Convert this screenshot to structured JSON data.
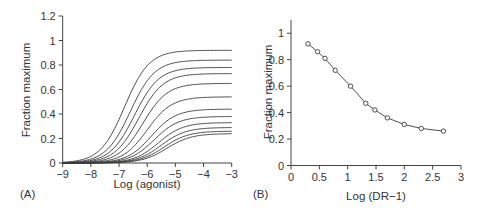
{
  "chart_data": [
    {
      "panel": "(A)",
      "type": "line",
      "title": "",
      "xlabel": "Log (agonist)",
      "ylabel": "Fraction maximum",
      "xlim": [
        -9,
        -3
      ],
      "ylim": [
        0,
        1.2
      ],
      "xticks": [
        -9,
        -8,
        -7,
        -6,
        -5,
        -4,
        -3
      ],
      "xtick_labels": [
        "−9",
        "−8",
        "−7",
        "−6",
        "−5",
        "−4",
        "−3"
      ],
      "yticks": [
        0,
        0.2,
        0.4,
        0.6,
        0.8,
        1,
        1.2
      ],
      "ytick_labels": [
        "0",
        "0.2",
        "0.4",
        "0.6",
        "0.8",
        "1",
        "1.2"
      ],
      "grid": false,
      "legend": null,
      "series": [
        {
          "name": "curve 1",
          "max": 0.92,
          "log_ec50": -6.8
        },
        {
          "name": "curve 2",
          "max": 0.84,
          "log_ec50": -6.6
        },
        {
          "name": "curve 3",
          "max": 0.78,
          "log_ec50": -6.45
        },
        {
          "name": "curve 4",
          "max": 0.73,
          "log_ec50": -6.3
        },
        {
          "name": "curve 5",
          "max": 0.65,
          "log_ec50": -6.15
        },
        {
          "name": "curve 6",
          "max": 0.54,
          "log_ec50": -6.0
        },
        {
          "name": "curve 7",
          "max": 0.44,
          "log_ec50": -5.85
        },
        {
          "name": "curve 8",
          "max": 0.38,
          "log_ec50": -5.75
        },
        {
          "name": "curve 9",
          "max": 0.33,
          "log_ec50": -5.6
        },
        {
          "name": "curve 10",
          "max": 0.29,
          "log_ec50": -5.5
        },
        {
          "name": "curve 11",
          "max": 0.26,
          "log_ec50": -5.4
        },
        {
          "name": "curve 12",
          "max": 0.24,
          "log_ec50": -5.3
        }
      ],
      "curve_form": "y = max / (1 + 10^((log_ec50 - x)))"
    },
    {
      "panel": "(B)",
      "type": "line",
      "title": "",
      "xlabel": "Log (DR−1)",
      "ylabel": "Fraction maximum",
      "xlim": [
        0,
        3
      ],
      "ylim": [
        0,
        1.1
      ],
      "xticks": [
        0,
        0.5,
        1,
        1.5,
        2,
        2.5,
        3
      ],
      "xtick_labels": [
        "0",
        "0.5",
        "1",
        "1.5",
        "2",
        "2.5",
        "3"
      ],
      "yticks": [
        0,
        0.2,
        0.4,
        0.6,
        0.8,
        1
      ],
      "ytick_labels": [
        "0",
        "0.2",
        "0.4",
        "0.6",
        "0.8",
        "1"
      ],
      "grid": false,
      "legend": null,
      "markers": "open circles",
      "x": [
        0.3,
        0.47,
        0.6,
        0.78,
        1.05,
        1.32,
        1.48,
        1.7,
        2.0,
        2.3,
        2.69
      ],
      "y": [
        0.92,
        0.86,
        0.81,
        0.72,
        0.6,
        0.47,
        0.42,
        0.36,
        0.31,
        0.28,
        0.26
      ]
    }
  ]
}
